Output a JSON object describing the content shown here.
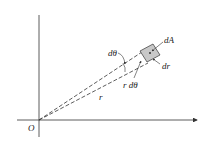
{
  "diagram": {
    "labels": {
      "origin": "O",
      "dA": "dA",
      "dr": "dr",
      "dtheta": "dθ",
      "r": "r",
      "rdtheta": "r dθ"
    },
    "colors": {
      "line": "#333333",
      "shade": "#c8c8c8"
    }
  }
}
